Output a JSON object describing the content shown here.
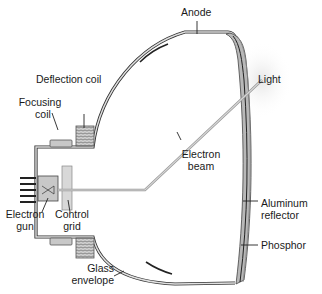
{
  "labels": {
    "anode": "Anode",
    "deflection_coil": "Deflection coil",
    "focusing_coil_1": "Focusing",
    "focusing_coil_2": "coil",
    "light": "Light",
    "electron_beam_1": "Electron",
    "electron_beam_2": "beam",
    "electron_gun_1": "Electron",
    "electron_gun_2": "gun",
    "control_grid_1": "Control",
    "control_grid_2": "grid",
    "aluminum_reflector_1": "Aluminum",
    "aluminum_reflector_2": "reflector",
    "phosphor": "Phosphor",
    "glass_envelope_1": "Glass",
    "glass_envelope_2": "envelope"
  },
  "colors": {
    "outline": "#333333",
    "glass_fill": "#d0d0d0",
    "screen_fill": "#b8b8b8",
    "component_fill": "#c8c8c8",
    "beam": "#bdbdbd"
  }
}
